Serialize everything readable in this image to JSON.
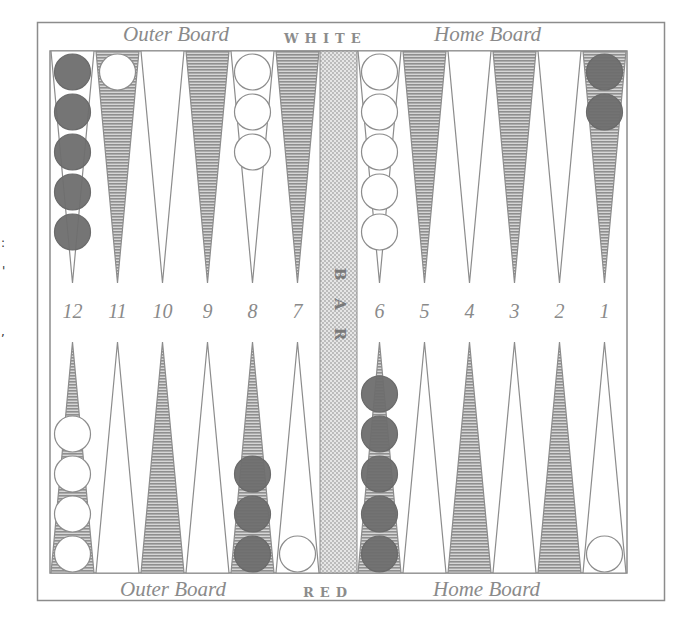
{
  "board": {
    "top_side": "WHITE",
    "bottom_side": "RED",
    "top_left_label": "Outer Board",
    "top_right_label": "Home Board",
    "bottom_left_label": "Outer Board",
    "bottom_right_label": "Home Board",
    "bar_label": [
      "B",
      "A",
      "R"
    ],
    "colors": {
      "frame": "#8c8c8c",
      "shaded_point": "#a8a8a8",
      "light_point": "#ffffff",
      "bar_fill": "#d8d8d8",
      "red_checker": "#6e6e6e",
      "white_checker": "#ffffff",
      "label": "#8a8a8a"
    }
  },
  "point_numbers": [
    "12",
    "11",
    "10",
    "9",
    "8",
    "7",
    "6",
    "5",
    "4",
    "3",
    "2",
    "1"
  ],
  "top_points": [
    {
      "number": "12",
      "shaded": false,
      "checkers": {
        "color": "red",
        "count": 5
      }
    },
    {
      "number": "11",
      "shaded": true,
      "checkers": {
        "color": "white",
        "count": 1
      }
    },
    {
      "number": "10",
      "shaded": false,
      "checkers": {
        "color": "none",
        "count": 0
      }
    },
    {
      "number": "9",
      "shaded": true,
      "checkers": {
        "color": "none",
        "count": 0
      }
    },
    {
      "number": "8",
      "shaded": false,
      "checkers": {
        "color": "white",
        "count": 3
      }
    },
    {
      "number": "7",
      "shaded": true,
      "checkers": {
        "color": "none",
        "count": 0
      }
    },
    {
      "number": "6",
      "shaded": false,
      "checkers": {
        "color": "white",
        "count": 5
      }
    },
    {
      "number": "5",
      "shaded": true,
      "checkers": {
        "color": "none",
        "count": 0
      }
    },
    {
      "number": "4",
      "shaded": false,
      "checkers": {
        "color": "none",
        "count": 0
      }
    },
    {
      "number": "3",
      "shaded": true,
      "checkers": {
        "color": "none",
        "count": 0
      }
    },
    {
      "number": "2",
      "shaded": false,
      "checkers": {
        "color": "none",
        "count": 0
      }
    },
    {
      "number": "1",
      "shaded": true,
      "checkers": {
        "color": "red",
        "count": 2
      }
    }
  ],
  "bottom_points": [
    {
      "number": "12",
      "shaded": true,
      "checkers": {
        "color": "white",
        "count": 4
      }
    },
    {
      "number": "11",
      "shaded": false,
      "checkers": {
        "color": "none",
        "count": 0
      }
    },
    {
      "number": "10",
      "shaded": true,
      "checkers": {
        "color": "none",
        "count": 0
      }
    },
    {
      "number": "9",
      "shaded": false,
      "checkers": {
        "color": "none",
        "count": 0
      }
    },
    {
      "number": "8",
      "shaded": true,
      "checkers": {
        "color": "red",
        "count": 3
      }
    },
    {
      "number": "7",
      "shaded": false,
      "checkers": {
        "color": "white",
        "count": 1
      }
    },
    {
      "number": "6",
      "shaded": true,
      "checkers": {
        "color": "red",
        "count": 5
      }
    },
    {
      "number": "5",
      "shaded": false,
      "checkers": {
        "color": "none",
        "count": 0
      }
    },
    {
      "number": "4",
      "shaded": true,
      "checkers": {
        "color": "none",
        "count": 0
      }
    },
    {
      "number": "3",
      "shaded": false,
      "checkers": {
        "color": "none",
        "count": 0
      }
    },
    {
      "number": "2",
      "shaded": true,
      "checkers": {
        "color": "none",
        "count": 0
      }
    },
    {
      "number": "1",
      "shaded": false,
      "checkers": {
        "color": "white",
        "count": 1
      }
    }
  ],
  "edge_marks": [
    ":",
    "'",
    ","
  ]
}
